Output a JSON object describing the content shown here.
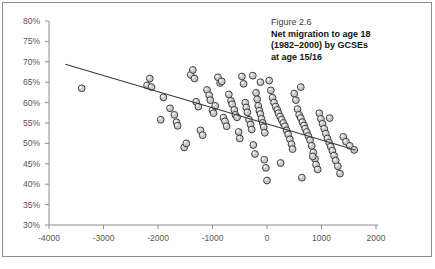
{
  "caption": {
    "figure_number": "Figure 2.6",
    "title_line1": "Net migration to age 18",
    "title_line2": "(1982–2000) by GCSEs",
    "title_line3": "at age 15/16"
  },
  "chart_data": {
    "type": "scatter",
    "title": "Net migration to age 18 (1982–2000) by GCSEs at age 15/16",
    "xlabel": "",
    "ylabel": "",
    "grid": false,
    "legend": null,
    "xlim": [
      -4000,
      2000
    ],
    "ylim": [
      30,
      80
    ],
    "x_ticks": [
      -4000,
      -3000,
      -2000,
      -1000,
      0,
      1000,
      2000
    ],
    "x_tick_labels": [
      "-4000",
      "-3000",
      "-2000",
      "-1000",
      "0",
      "1000",
      "2000"
    ],
    "y_ticks": [
      30,
      35,
      40,
      45,
      50,
      55,
      60,
      65,
      70,
      75,
      80
    ],
    "y_tick_labels": [
      "30%",
      "35%",
      "40%",
      "45%",
      "50%",
      "55%",
      "60%",
      "65%",
      "70%",
      "75%",
      "80%"
    ],
    "marker": {
      "shape": "circle",
      "fill": "#c9c9c9",
      "edge": "#2e2e2e",
      "radius_px": 3.4
    },
    "trendline": {
      "type": "linear",
      "color": "#3a3a3a",
      "x_start": -3700,
      "y_start": 69.4,
      "x_end": 1620,
      "y_end": 48.4
    },
    "points": [
      [
        -3400,
        63.5
      ],
      [
        -2200,
        64.2
      ],
      [
        -2150,
        65.9
      ],
      [
        -2120,
        63.8
      ],
      [
        -1900,
        61.3
      ],
      [
        -1700,
        57.0
      ],
      [
        -1660,
        55.2
      ],
      [
        -1640,
        54.3
      ],
      [
        -1520,
        49.0
      ],
      [
        -1480,
        50.0
      ],
      [
        -1400,
        66.8
      ],
      [
        -1360,
        68.0
      ],
      [
        -1330,
        65.9
      ],
      [
        -1300,
        60.2
      ],
      [
        -1260,
        59.0
      ],
      [
        -1220,
        53.2
      ],
      [
        -1180,
        52.0
      ],
      [
        -1100,
        63.1
      ],
      [
        -1060,
        61.8
      ],
      [
        -1040,
        60.6
      ],
      [
        -1000,
        58.1
      ],
      [
        -980,
        57.4
      ],
      [
        -950,
        59.2
      ],
      [
        -900,
        66.2
      ],
      [
        -860,
        64.8
      ],
      [
        -830,
        65.2
      ],
      [
        -800,
        56.3
      ],
      [
        -770,
        55.4
      ],
      [
        -740,
        54.2
      ],
      [
        -700,
        62.0
      ],
      [
        -660,
        60.4
      ],
      [
        -640,
        59.6
      ],
      [
        -600,
        58.2
      ],
      [
        -580,
        57.0
      ],
      [
        -550,
        56.4
      ],
      [
        -520,
        52.8
      ],
      [
        -500,
        51.2
      ],
      [
        -460,
        66.4
      ],
      [
        -430,
        64.6
      ],
      [
        -400,
        60.0
      ],
      [
        -380,
        58.8
      ],
      [
        -360,
        57.6
      ],
      [
        -330,
        55.8
      ],
      [
        -300,
        54.6
      ],
      [
        -280,
        53.4
      ],
      [
        -250,
        49.6
      ],
      [
        -220,
        47.4
      ],
      [
        -200,
        62.4
      ],
      [
        -180,
        60.8
      ],
      [
        -160,
        59.2
      ],
      [
        -140,
        58.0
      ],
      [
        -120,
        57.2
      ],
      [
        -100,
        56.0
      ],
      [
        -80,
        55.0
      ],
      [
        -60,
        54.0
      ],
      [
        -40,
        52.6
      ],
      [
        -20,
        44.0
      ],
      [
        0,
        40.9
      ],
      [
        40,
        65.4
      ],
      [
        70,
        63.0
      ],
      [
        100,
        61.2
      ],
      [
        130,
        60.0
      ],
      [
        160,
        59.0
      ],
      [
        190,
        58.2
      ],
      [
        210,
        57.4
      ],
      [
        240,
        56.6
      ],
      [
        270,
        55.8
      ],
      [
        300,
        55.0
      ],
      [
        330,
        54.2
      ],
      [
        360,
        53.2
      ],
      [
        390,
        52.2
      ],
      [
        420,
        51.0
      ],
      [
        450,
        49.8
      ],
      [
        470,
        48.6
      ],
      [
        500,
        62.2
      ],
      [
        530,
        60.6
      ],
      [
        560,
        58.4
      ],
      [
        590,
        57.0
      ],
      [
        620,
        56.2
      ],
      [
        650,
        55.2
      ],
      [
        680,
        54.4
      ],
      [
        700,
        53.6
      ],
      [
        730,
        52.8
      ],
      [
        760,
        51.8
      ],
      [
        790,
        50.8
      ],
      [
        820,
        49.4
      ],
      [
        850,
        47.8
      ],
      [
        880,
        46.2
      ],
      [
        900,
        44.8
      ],
      [
        930,
        43.6
      ],
      [
        960,
        57.4
      ],
      [
        990,
        56.0
      ],
      [
        1020,
        54.8
      ],
      [
        1050,
        53.6
      ],
      [
        1080,
        52.4
      ],
      [
        1110,
        51.2
      ],
      [
        1140,
        50.2
      ],
      [
        1170,
        49.2
      ],
      [
        1200,
        48.2
      ],
      [
        1230,
        47.0
      ],
      [
        1260,
        45.8
      ],
      [
        1300,
        44.4
      ],
      [
        1340,
        42.6
      ],
      [
        1400,
        51.6
      ],
      [
        1450,
        50.4
      ],
      [
        1520,
        49.4
      ],
      [
        1600,
        48.4
      ],
      [
        -1950,
        55.8
      ],
      [
        -1780,
        58.6
      ],
      [
        -260,
        66.6
      ],
      [
        -120,
        65.0
      ],
      [
        620,
        63.8
      ],
      [
        840,
        46.8
      ],
      [
        1150,
        56.2
      ],
      [
        640,
        41.6
      ],
      [
        250,
        45.2
      ],
      [
        -50,
        46.0
      ]
    ]
  }
}
